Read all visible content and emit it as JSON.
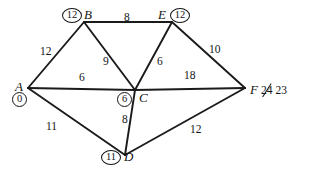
{
  "diagram": {
    "type": "weighted-undirected-graph",
    "title": "",
    "canvas": {
      "width": 312,
      "height": 171
    },
    "nodes": [
      {
        "id": "A",
        "label": "A",
        "x": 28,
        "y": 88,
        "distance": "0",
        "badge_position": "below"
      },
      {
        "id": "B",
        "label": "B",
        "x": 84,
        "y": 22,
        "distance": "12",
        "badge_position": "left"
      },
      {
        "id": "C",
        "label": "C",
        "x": 135,
        "y": 90,
        "distance": "6",
        "badge_position": "left"
      },
      {
        "id": "D",
        "label": "D",
        "x": 125,
        "y": 155,
        "distance": "11",
        "badge_position": "left"
      },
      {
        "id": "E",
        "label": "E",
        "x": 172,
        "y": 22,
        "distance": "12",
        "badge_position": "right"
      },
      {
        "id": "F",
        "label": "F",
        "x": 245,
        "y": 88,
        "distance": "23",
        "distance_old": "24",
        "badge_position": "inline-right"
      }
    ],
    "edges": [
      {
        "id": "AB",
        "from": "A",
        "to": "B",
        "weight": "12",
        "lx": 40,
        "ly": 46
      },
      {
        "id": "BE",
        "from": "B",
        "to": "E",
        "weight": "8",
        "lx": 124,
        "ly": 12
      },
      {
        "id": "BC",
        "from": "B",
        "to": "C",
        "weight": "9",
        "lx": 103,
        "ly": 56
      },
      {
        "id": "CE",
        "from": "C",
        "to": "E",
        "weight": "6",
        "lx": 157,
        "ly": 56
      },
      {
        "id": "EF",
        "from": "E",
        "to": "F",
        "weight": "10",
        "lx": 209,
        "ly": 44
      },
      {
        "id": "AC",
        "from": "A",
        "to": "C",
        "weight": "6",
        "lx": 79,
        "ly": 73
      },
      {
        "id": "CF",
        "from": "C",
        "to": "F",
        "weight": "18",
        "lx": 186,
        "ly": 71
      },
      {
        "id": "AD",
        "from": "A",
        "to": "D",
        "weight": "11",
        "lx": 46,
        "ly": 122
      },
      {
        "id": "CD",
        "from": "C",
        "to": "D",
        "weight": "8",
        "lx": 122,
        "ly": 115
      },
      {
        "id": "DF",
        "from": "D",
        "to": "F",
        "weight": "12",
        "lx": 190,
        "ly": 124
      }
    ],
    "colors": {
      "stroke": "#1b1b1b",
      "text": "#141414",
      "background": "#ffffff"
    }
  }
}
